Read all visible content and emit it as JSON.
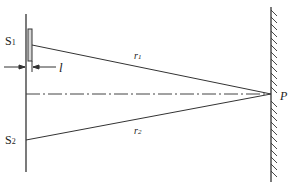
{
  "diagram": {
    "type": "double-slit interference with glass slab",
    "labels": {
      "s1": "S",
      "s1_sub": "1",
      "s2": "S",
      "s2_sub": "2",
      "thickness": "l",
      "r1": "r",
      "r1_sub": "1",
      "r2": "r",
      "r2_sub": "2",
      "point": "P"
    },
    "colors": {
      "line": "#333333",
      "slab": "#d8d8d8"
    }
  }
}
